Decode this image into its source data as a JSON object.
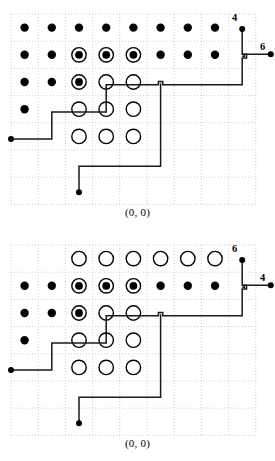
{
  "figure": {
    "background": "#ffffff",
    "grid_color": "#b9b9b9",
    "path_color": "#1a1a1a",
    "marker_fill_color": "#000000",
    "marker_open_color": "#ffffff"
  },
  "geometry": {
    "cell": 27.2,
    "origin_x": 11.0,
    "origin_y": 14.0,
    "cols": 9,
    "rows": 7,
    "marker_radius_filled": 4.2,
    "marker_radius_open": 7.2,
    "marker_radius_ring_outer": 7.2,
    "marker_radius_ring_core": 3.9,
    "endpoint_radius": 3.0
  },
  "panels": [
    {
      "id": "panel-top",
      "caption": "(0, 0)",
      "markers": [
        {
          "col": 1,
          "row": 1,
          "type": "filled"
        },
        {
          "col": 2,
          "row": 1,
          "type": "filled"
        },
        {
          "col": 3,
          "row": 1,
          "type": "filled"
        },
        {
          "col": 4,
          "row": 1,
          "type": "filled"
        },
        {
          "col": 5,
          "row": 1,
          "type": "filled"
        },
        {
          "col": 6,
          "row": 1,
          "type": "filled"
        },
        {
          "col": 7,
          "row": 1,
          "type": "filled"
        },
        {
          "col": 8,
          "row": 1,
          "type": "filled"
        },
        {
          "col": 1,
          "row": 2,
          "type": "filled"
        },
        {
          "col": 2,
          "row": 2,
          "type": "filled"
        },
        {
          "col": 3,
          "row": 2,
          "type": "ring"
        },
        {
          "col": 4,
          "row": 2,
          "type": "ring"
        },
        {
          "col": 5,
          "row": 2,
          "type": "ring"
        },
        {
          "col": 6,
          "row": 2,
          "type": "filled"
        },
        {
          "col": 7,
          "row": 2,
          "type": "filled"
        },
        {
          "col": 8,
          "row": 2,
          "type": "filled"
        },
        {
          "col": 1,
          "row": 3,
          "type": "filled"
        },
        {
          "col": 2,
          "row": 3,
          "type": "filled"
        },
        {
          "col": 3,
          "row": 3,
          "type": "ring"
        },
        {
          "col": 4,
          "row": 3,
          "type": "open"
        },
        {
          "col": 5,
          "row": 3,
          "type": "open"
        },
        {
          "col": 1,
          "row": 4,
          "type": "filled"
        },
        {
          "col": 3,
          "row": 4,
          "type": "open"
        },
        {
          "col": 4,
          "row": 4,
          "type": "open"
        },
        {
          "col": 5,
          "row": 4,
          "type": "open"
        },
        {
          "col": 3,
          "row": 5,
          "type": "open"
        },
        {
          "col": 4,
          "row": 5,
          "type": "open"
        },
        {
          "col": 5,
          "row": 5,
          "type": "open"
        }
      ],
      "path_points": [
        [
          0.0,
          4.6
        ],
        [
          1.5,
          4.6
        ],
        [
          1.5,
          3.6
        ],
        [
          3.5,
          3.6
        ],
        [
          3.5,
          2.6
        ],
        [
          5.42,
          2.6
        ],
        [
          5.42,
          2.48
        ],
        [
          5.58,
          2.48
        ],
        [
          5.58,
          2.6
        ],
        [
          8.5,
          2.6
        ],
        [
          8.5,
          1.62
        ],
        [
          8.66,
          1.62
        ],
        [
          8.66,
          1.48
        ],
        [
          8.5,
          1.48
        ],
        [
          8.5,
          0.55
        ]
      ],
      "path_points_branch": [
        [
          8.5,
          1.55
        ],
        [
          8.58,
          1.55
        ],
        [
          8.58,
          1.48
        ],
        [
          9.55,
          1.48
        ]
      ],
      "path_points_tail": [
        [
          5.5,
          2.55
        ],
        [
          5.5,
          5.6
        ],
        [
          2.5,
          5.6
        ],
        [
          2.5,
          6.55
        ]
      ],
      "endpoints": [
        {
          "col": 0.0,
          "row": 4.6,
          "name": "left-endpoint"
        },
        {
          "col": 2.5,
          "row": 6.55,
          "name": "bottom-endpoint"
        },
        {
          "col": 8.5,
          "row": 0.55,
          "name": "vertical-endpoint"
        },
        {
          "col": 9.55,
          "row": 1.48,
          "name": "horizontal-endpoint"
        }
      ],
      "labels": [
        {
          "text": "4",
          "name": "vertical-endpoint-label",
          "x": 232,
          "y": 12
        },
        {
          "text": "6",
          "name": "horizontal-endpoint-label",
          "x": 260,
          "y": 41
        }
      ]
    },
    {
      "id": "panel-bottom",
      "caption": "(0, 0)",
      "markers": [
        {
          "col": 3,
          "row": 1,
          "type": "open"
        },
        {
          "col": 4,
          "row": 1,
          "type": "open"
        },
        {
          "col": 5,
          "row": 1,
          "type": "open"
        },
        {
          "col": 6,
          "row": 1,
          "type": "open"
        },
        {
          "col": 7,
          "row": 1,
          "type": "open"
        },
        {
          "col": 8,
          "row": 1,
          "type": "open"
        },
        {
          "col": 1,
          "row": 2,
          "type": "filled"
        },
        {
          "col": 2,
          "row": 2,
          "type": "filled"
        },
        {
          "col": 3,
          "row": 2,
          "type": "ring"
        },
        {
          "col": 4,
          "row": 2,
          "type": "ring"
        },
        {
          "col": 5,
          "row": 2,
          "type": "ring"
        },
        {
          "col": 6,
          "row": 2,
          "type": "filled"
        },
        {
          "col": 7,
          "row": 2,
          "type": "filled"
        },
        {
          "col": 8,
          "row": 2,
          "type": "filled"
        },
        {
          "col": 1,
          "row": 3,
          "type": "filled"
        },
        {
          "col": 2,
          "row": 3,
          "type": "filled"
        },
        {
          "col": 3,
          "row": 3,
          "type": "ring"
        },
        {
          "col": 4,
          "row": 3,
          "type": "open"
        },
        {
          "col": 5,
          "row": 3,
          "type": "open"
        },
        {
          "col": 1,
          "row": 4,
          "type": "filled"
        },
        {
          "col": 3,
          "row": 4,
          "type": "open"
        },
        {
          "col": 4,
          "row": 4,
          "type": "open"
        },
        {
          "col": 5,
          "row": 4,
          "type": "open"
        },
        {
          "col": 3,
          "row": 5,
          "type": "open"
        },
        {
          "col": 4,
          "row": 5,
          "type": "open"
        },
        {
          "col": 5,
          "row": 5,
          "type": "open"
        }
      ],
      "path_points": [
        [
          0.0,
          4.6
        ],
        [
          1.5,
          4.6
        ],
        [
          1.5,
          3.6
        ],
        [
          3.5,
          3.6
        ],
        [
          3.5,
          2.6
        ],
        [
          5.42,
          2.6
        ],
        [
          5.42,
          2.48
        ],
        [
          5.58,
          2.48
        ],
        [
          5.58,
          2.6
        ],
        [
          8.5,
          2.6
        ],
        [
          8.5,
          1.62
        ],
        [
          8.66,
          1.62
        ],
        [
          8.66,
          1.48
        ],
        [
          8.5,
          1.48
        ],
        [
          8.5,
          0.55
        ]
      ],
      "path_points_branch": [
        [
          8.5,
          1.55
        ],
        [
          8.58,
          1.55
        ],
        [
          8.58,
          1.48
        ],
        [
          9.55,
          1.48
        ]
      ],
      "path_points_tail": [
        [
          5.5,
          2.55
        ],
        [
          5.5,
          5.6
        ],
        [
          2.5,
          5.6
        ],
        [
          2.5,
          6.55
        ]
      ],
      "endpoints": [
        {
          "col": 0.0,
          "row": 4.6,
          "name": "left-endpoint"
        },
        {
          "col": 2.5,
          "row": 6.55,
          "name": "bottom-endpoint"
        },
        {
          "col": 8.5,
          "row": 0.55,
          "name": "vertical-endpoint"
        },
        {
          "col": 9.55,
          "row": 1.48,
          "name": "horizontal-endpoint"
        }
      ],
      "labels": [
        {
          "text": "6",
          "name": "vertical-endpoint-label",
          "x": 232,
          "y": 12
        },
        {
          "text": "4",
          "name": "horizontal-endpoint-label",
          "x": 260,
          "y": 41
        }
      ]
    }
  ]
}
